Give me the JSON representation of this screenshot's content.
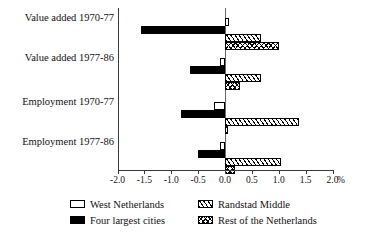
{
  "chart_data": {
    "type": "bar",
    "orientation": "horizontal",
    "title": "",
    "xlabel": "%",
    "ylabel": "",
    "xlim": [
      -2.0,
      2.0
    ],
    "grid": false,
    "legend_position": "bottom",
    "categories": [
      "Value added 1970-77",
      "Value added 1977-86",
      "Employment 1970-77",
      "Employment 1977-86"
    ],
    "xticks": [
      "-2.0",
      "-1.5",
      "-1.0",
      "-0.5",
      "0.0",
      "0.5",
      "1.0",
      "1.5",
      "2.0"
    ],
    "xtick_values": [
      -2.0,
      -1.5,
      -1.0,
      -0.5,
      0.0,
      0.5,
      1.0,
      1.5,
      2.0
    ],
    "unit_suffix": "%",
    "series": [
      {
        "name": "West Netherlands",
        "pattern": "white",
        "values": [
          0.07,
          -0.1,
          -0.2,
          -0.1
        ]
      },
      {
        "name": "Four largest cities",
        "pattern": "solid-black",
        "values": [
          -1.56,
          -0.65,
          -0.82,
          -0.5
        ]
      },
      {
        "name": "Randstad Middle",
        "pattern": "diagonal-hatch",
        "values": [
          0.67,
          0.67,
          1.37,
          1.05
        ]
      },
      {
        "name": "Rest of the Netherlands",
        "pattern": "cross-hatch",
        "values": [
          1.0,
          0.27,
          0.05,
          0.18
        ]
      }
    ]
  },
  "legend": {
    "items": [
      {
        "label": "West Netherlands",
        "pattern": "white"
      },
      {
        "label": "Randstad Middle",
        "pattern": "diagonal-hatch"
      },
      {
        "label": "Four largest cities",
        "pattern": "solid-black"
      },
      {
        "label": "Rest of the Netherlands",
        "pattern": "cross-hatch"
      }
    ]
  },
  "colors": {
    "axis": "#3a3a3a",
    "zero_axis": "#6a6a6a",
    "bar_outline": "#000000",
    "background": "#ffffff"
  }
}
